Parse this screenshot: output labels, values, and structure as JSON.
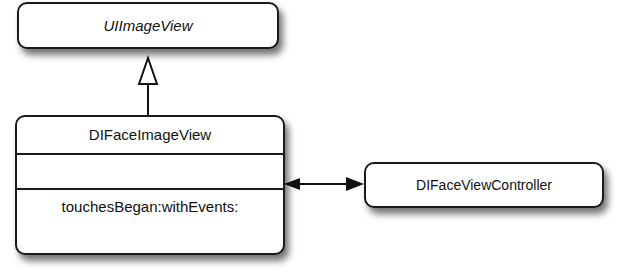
{
  "diagram": {
    "type": "UML class diagram",
    "classes": [
      {
        "name": "UIImageView",
        "italic": true,
        "attributes": [],
        "methods": []
      },
      {
        "name": "DIFaceImageView",
        "attributes": [],
        "methods": [
          "touchesBegan:withEvents:"
        ]
      },
      {
        "name": "DIFaceViewController",
        "attributes": [],
        "methods": []
      }
    ],
    "relations": [
      {
        "from": "DIFaceImageView",
        "to": "UIImageView",
        "kind": "inheritance"
      },
      {
        "from": "DIFaceImageView",
        "to": "DIFaceViewController",
        "kind": "bidirectional-association"
      }
    ]
  }
}
